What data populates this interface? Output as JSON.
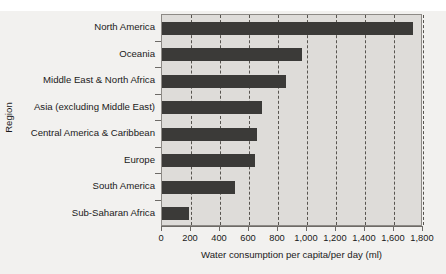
{
  "chart_data": {
    "type": "bar",
    "orientation": "horizontal",
    "title": "",
    "xlabel": "Water consumption per capita/per day (ml)",
    "ylabel": "Region",
    "xlim": [
      0,
      1800
    ],
    "xticks": [
      0,
      200,
      400,
      600,
      800,
      1000,
      1200,
      1400,
      1600,
      1800
    ],
    "xtick_labels": [
      "0",
      "200",
      "400",
      "600",
      "800",
      "1,000",
      "1,200",
      "1,400",
      "1,600",
      "1,800"
    ],
    "grid": "vertical-dashed",
    "legend": "none",
    "bar_color": "#3b3a38",
    "plot_background": "#dedcd9",
    "categories": [
      "North America",
      "Oceania",
      "Middle East & North Africa",
      "Asia (excluding Middle East)",
      "Central America & Caribbean",
      "Europe",
      "South America",
      "Sub-Saharan Africa"
    ],
    "values": [
      1730,
      965,
      855,
      690,
      655,
      640,
      500,
      185
    ]
  }
}
